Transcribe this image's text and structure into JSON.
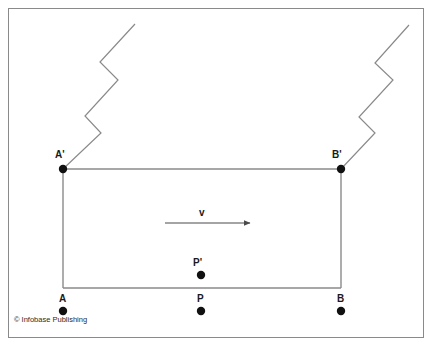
{
  "figure": {
    "background_color": "#ffffff",
    "frame_color": "#8a8a8a",
    "line_color": "#7a7a7a",
    "point_color": "#111111",
    "text_color": "#1a1a1a"
  },
  "labels": {
    "a_prime": "A'",
    "b_prime": "B'",
    "p_prime": "P'",
    "a": "A",
    "b": "B",
    "p": "P",
    "velocity": "v"
  },
  "credit": {
    "text": "© Infobase Publishing"
  },
  "geometry": {
    "frame": {
      "x": 8,
      "y": 8,
      "width": 416,
      "height": 330
    },
    "rectangle": {
      "x1": 63,
      "y1": 169,
      "x2": 341,
      "y2": 288
    },
    "velocity_arrow": {
      "x1": 165,
      "y1": 223,
      "x2": 250,
      "y2": 223
    },
    "points": [
      {
        "name": "A'",
        "x": 63,
        "y": 169,
        "r": 4
      },
      {
        "name": "B'",
        "x": 341,
        "y": 169,
        "r": 4
      },
      {
        "name": "P'",
        "x": 201,
        "y": 275,
        "r": 4
      },
      {
        "name": "A",
        "x": 63,
        "y": 311,
        "r": 4
      },
      {
        "name": "P",
        "x": 201,
        "y": 311,
        "r": 4
      },
      {
        "name": "B",
        "x": 341,
        "y": 311,
        "r": 4
      }
    ],
    "zigzag_left": "63,169 101,133 85,116 118,80 100,62 135,24",
    "zigzag_right": "341,169 375,133 359,117 393,80 375,63 409,25"
  }
}
